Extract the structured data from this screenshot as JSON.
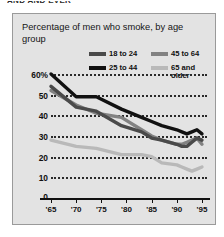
{
  "clipped_headline": "AND AND EVER",
  "panel": {
    "background": "#e3e3e3",
    "border": "#9a9a9a"
  },
  "chart_data": {
    "type": "line",
    "title": "Percentage of men who smoke, by age group",
    "xlabel": "",
    "ylabel": "",
    "ylim": [
      0,
      60
    ],
    "xlim": [
      1965,
      1996
    ],
    "grid": true,
    "legend_position": "top-right",
    "yticks": [
      60,
      50,
      40,
      30,
      20,
      10,
      0
    ],
    "ytick_labels": [
      "60%",
      "50",
      "40",
      "30",
      "20",
      "10",
      "0"
    ],
    "xticks": [
      1965,
      1970,
      1975,
      1980,
      1985,
      1990,
      1995
    ],
    "xtick_labels": [
      "'65",
      "'70",
      "'75",
      "'80",
      "'85",
      "'90",
      "'95"
    ],
    "series": [
      {
        "name": "18 to 24",
        "color": "#4a4a4a",
        "x": [
          1965,
          1970,
          1974,
          1979,
          1983,
          1985,
          1987,
          1990,
          1991,
          1992,
          1993,
          1994,
          1995
        ],
        "values": [
          54,
          44,
          42,
          35,
          32,
          29,
          28,
          26,
          25,
          25,
          27,
          29,
          28
        ]
      },
      {
        "name": "25 to 44",
        "color": "#111111",
        "x": [
          1965,
          1970,
          1974,
          1979,
          1983,
          1985,
          1987,
          1990,
          1991,
          1992,
          1993,
          1994,
          1995
        ],
        "values": [
          60,
          49,
          49,
          43,
          39,
          37,
          35,
          33,
          32,
          31,
          32,
          33,
          31
        ]
      },
      {
        "name": "45 to 64",
        "color": "#828282",
        "x": [
          1965,
          1970,
          1974,
          1979,
          1983,
          1985,
          1987,
          1990,
          1991,
          1992,
          1993,
          1994,
          1995
        ],
        "values": [
          52,
          45,
          41,
          39,
          33,
          30,
          28,
          26,
          26,
          27,
          28,
          29,
          26
        ]
      },
      {
        "name": "65 and older",
        "color": "#b9b9b9",
        "x": [
          1965,
          1970,
          1974,
          1979,
          1983,
          1985,
          1987,
          1990,
          1991,
          1992,
          1993,
          1994,
          1995
        ],
        "values": [
          28,
          25,
          24,
          21,
          21,
          20,
          17,
          16,
          15,
          14,
          13,
          14,
          15
        ]
      }
    ]
  }
}
